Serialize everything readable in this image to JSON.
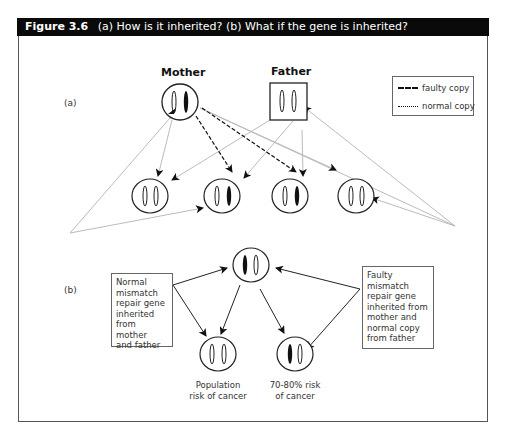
{
  "figure": {
    "number": "Figure 3.6",
    "title": "(a) How is it inherited? (b) What if the gene is inherited?"
  },
  "part_a": {
    "label": "(a)",
    "mother_label": "Mother",
    "father_label": "Father",
    "legend": {
      "items": [
        {
          "style": "dashed",
          "label": "faulty copy"
        },
        {
          "style": "dotted",
          "label": "normal copy"
        }
      ]
    },
    "parents": {
      "mother": {
        "shape": "circle",
        "chromosomes": [
          "normal",
          "faulty"
        ]
      },
      "father": {
        "shape": "square",
        "chromosomes": [
          "normal",
          "normal"
        ]
      }
    },
    "offspring": [
      {
        "chromosomes": [
          "normal",
          "normal"
        ]
      },
      {
        "chromosomes": [
          "normal",
          "faulty"
        ]
      },
      {
        "chromosomes": [
          "normal",
          "faulty"
        ]
      },
      {
        "chromosomes": [
          "normal",
          "normal"
        ]
      }
    ]
  },
  "part_b": {
    "label": "(b)",
    "left_box": "Normal mismatch repair gene inherited from mother and father",
    "left_box_lines": [
      "Normal",
      "mismatch",
      "repair gene",
      "inherited",
      "from mother",
      "and father"
    ],
    "right_box_lines": [
      "Faulty",
      "mismatch",
      "repair gene",
      "inherited from",
      "mother and",
      "normal copy",
      "from father"
    ],
    "outcomes": [
      {
        "caption_lines": [
          "Population",
          "risk of cancer"
        ],
        "chromosomes": [
          "normal",
          "normal"
        ]
      },
      {
        "caption_lines": [
          "70-80% risk",
          "of cancer"
        ],
        "chromosomes": [
          "faulty",
          "normal"
        ]
      }
    ]
  },
  "colors": {
    "header_bg": "#0a0a0a",
    "header_text": "#ffffff",
    "line_dark": "#222222",
    "line_light": "#bbbbbb",
    "faulty_fill": "#111111"
  }
}
